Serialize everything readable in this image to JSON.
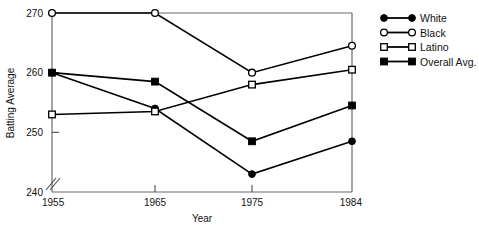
{
  "chart_data": {
    "type": "line",
    "title": "",
    "xlabel": "Year",
    "ylabel": "Batting Average",
    "categories": [
      "1955",
      "1965",
      "1975",
      "1984"
    ],
    "x": [
      1955,
      1965,
      1975,
      1984
    ],
    "xlim": [
      1955,
      1984
    ],
    "ylim": [
      240,
      270
    ],
    "yticks": [
      240,
      250,
      260,
      270
    ],
    "ytick_labels": [
      "240",
      "250",
      "260",
      "270"
    ],
    "xtick_labels": [
      "1955",
      "1965",
      "1975",
      "1984"
    ],
    "y_axis_break": true,
    "grid": false,
    "legend_position": "right",
    "series": [
      {
        "name": "White",
        "marker": "filled-circle",
        "values": [
          260,
          254,
          243,
          248.5
        ]
      },
      {
        "name": "Black",
        "marker": "open-circle",
        "values": [
          270,
          270,
          260,
          264.5
        ]
      },
      {
        "name": "Latino",
        "marker": "open-square",
        "values": [
          253,
          253.5,
          258,
          260.5
        ]
      },
      {
        "name": "Overall Avg.",
        "marker": "filled-square",
        "values": [
          260,
          258.5,
          248.5,
          254.5
        ]
      }
    ]
  },
  "legend": {
    "entries": [
      {
        "label": "White",
        "marker": "filled-circle"
      },
      {
        "label": "Black",
        "marker": "open-circle"
      },
      {
        "label": "Latino",
        "marker": "open-square"
      },
      {
        "label": "Overall Avg.",
        "marker": "filled-square"
      }
    ]
  },
  "colors": {
    "line": "#000000",
    "axis": "#5a5a5a",
    "text": "#111111",
    "background": "#ffffff"
  }
}
